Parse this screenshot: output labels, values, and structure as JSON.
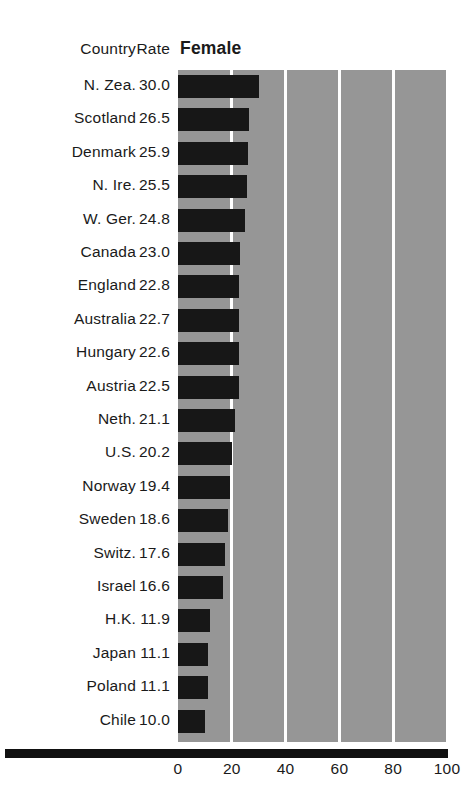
{
  "table_headers": {
    "country": "Country",
    "rate": "Rate"
  },
  "chart_data": {
    "type": "bar",
    "orientation": "horizontal",
    "title": "Female",
    "xlabel": "",
    "ylabel": "",
    "xlim": [
      0,
      100
    ],
    "xticks": [
      0,
      20,
      40,
      60,
      80,
      100
    ],
    "xtick_labels": [
      "0",
      "20",
      "40",
      "60",
      "80",
      "100"
    ],
    "grid": "vertical-white-gridlines-at-xticks",
    "legend": "none",
    "plot_background": "#969696",
    "bar_color": "#171717",
    "gridline_color": "#ffffff",
    "categories": [
      "N. Zea.",
      "Scotland",
      "Denmark",
      "N. Ire.",
      "W. Ger.",
      "Canada",
      "England",
      "Australia",
      "Hungary",
      "Austria",
      "Neth.",
      "U.S.",
      "Norway",
      "Sweden",
      "Switz.",
      "Israel",
      "H.K.",
      "Japan",
      "Poland",
      "Chile"
    ],
    "values": [
      30.0,
      26.5,
      25.9,
      25.5,
      24.8,
      23.0,
      22.8,
      22.7,
      22.6,
      22.5,
      21.1,
      20.2,
      19.4,
      18.6,
      17.6,
      16.6,
      11.9,
      11.1,
      11.1,
      10.0
    ],
    "value_labels": [
      "30.0",
      "26.5",
      "25.9",
      "25.5",
      "24.8",
      "23.0",
      "22.8",
      "22.7",
      "22.6",
      "22.5",
      "21.1",
      "20.2",
      "19.4",
      "18.6",
      "17.6",
      "16.6",
      "11.9",
      "11.1",
      "11.1",
      "10.0"
    ]
  }
}
